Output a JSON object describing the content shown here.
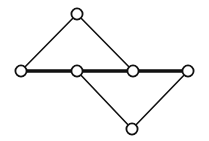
{
  "diagram": {
    "type": "graph",
    "background": "#ffffff",
    "stroke_color": "#111111",
    "node_fill": "#ffffff",
    "node_radius": 5.6,
    "nodes": [
      {
        "id": "top",
        "x": 77,
        "y": 14
      },
      {
        "id": "left",
        "x": 21,
        "y": 71
      },
      {
        "id": "mid-left",
        "x": 77,
        "y": 71
      },
      {
        "id": "mid-right",
        "x": 133,
        "y": 71
      },
      {
        "id": "right",
        "x": 188,
        "y": 71
      },
      {
        "id": "bottom",
        "x": 132,
        "y": 129
      }
    ],
    "edges": [
      {
        "from": "left",
        "to": "mid-left",
        "weight": "thick"
      },
      {
        "from": "mid-left",
        "to": "mid-right",
        "weight": "thick"
      },
      {
        "from": "mid-right",
        "to": "right",
        "weight": "thick"
      },
      {
        "from": "left",
        "to": "top",
        "weight": "thin"
      },
      {
        "from": "top",
        "to": "mid-right",
        "weight": "thin"
      },
      {
        "from": "mid-left",
        "to": "bottom",
        "weight": "thin"
      },
      {
        "from": "bottom",
        "to": "right",
        "weight": "thin"
      }
    ]
  }
}
